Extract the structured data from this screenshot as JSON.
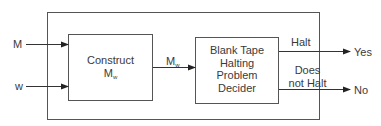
{
  "diagram": {
    "type": "block-diagram",
    "inputs": [
      {
        "id": "M",
        "label": "M"
      },
      {
        "id": "w",
        "label": "w"
      }
    ],
    "blocks": [
      {
        "id": "construct",
        "label_main": "Construct",
        "label_sym": "M",
        "label_sub": "w"
      },
      {
        "id": "decider",
        "lines": [
          "Blank Tape",
          "Halting",
          "Problem",
          "Decider"
        ]
      }
    ],
    "edges": [
      {
        "from": "M",
        "to": "construct"
      },
      {
        "from": "w",
        "to": "construct"
      },
      {
        "from": "construct",
        "to": "decider",
        "label_sym": "M",
        "label_sub": "w"
      },
      {
        "from": "decider",
        "to": "Yes",
        "label": "Halt"
      },
      {
        "from": "decider",
        "to": "No",
        "label_lines": [
          "Does",
          "not Halt"
        ]
      }
    ],
    "outputs": [
      {
        "id": "Yes",
        "label": "Yes"
      },
      {
        "id": "No",
        "label": "No"
      }
    ]
  }
}
